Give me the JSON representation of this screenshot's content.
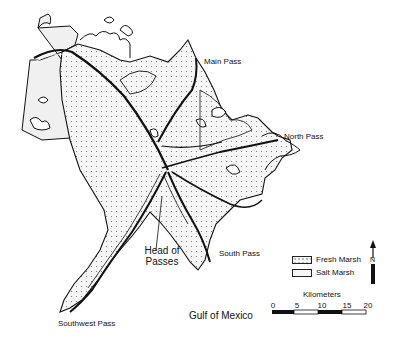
{
  "map": {
    "labels": {
      "main_pass": "Main Pass",
      "north_pass": "North Pass",
      "south_pass": "South Pass",
      "head_of_passes_line1": "Head of",
      "head_of_passes_line2": "Passes",
      "southwest_pass": "Southwest Pass",
      "gulf": "Gulf of Mexico"
    },
    "legend": {
      "items": [
        {
          "label": "Fresh Marsh",
          "pattern": "dotted"
        },
        {
          "label": "Salt Marsh",
          "pattern": "plain"
        }
      ]
    },
    "scale": {
      "title": "Kilometers",
      "ticks": [
        "0",
        "5",
        "10",
        "15",
        "20"
      ]
    },
    "north_arrow": {
      "label": "N"
    },
    "colors": {
      "line": "#111111",
      "fresh_fill": "#f4f4f4",
      "salt_fill": "#f2f2f2",
      "dot": "#777777"
    }
  }
}
